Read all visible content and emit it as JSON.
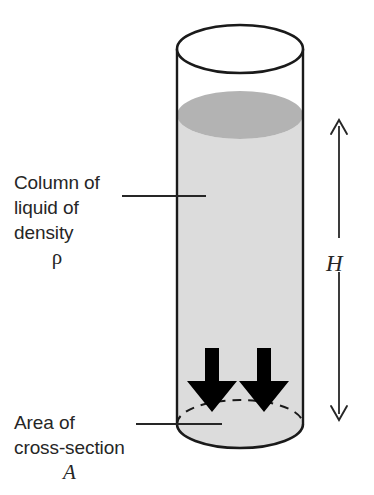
{
  "diagram": {
    "labels": {
      "column_line1": "Column of",
      "column_line2": "liquid of",
      "column_line3": "density",
      "column_symbol": "ρ",
      "area_line1": "Area of",
      "area_line2": "cross-section",
      "area_symbol": "A",
      "height_symbol": "H"
    },
    "colors": {
      "outline": "#1a1a1a",
      "liquid_body": "#dcdcdc",
      "liquid_surface": "#b4b4b4",
      "arrow_fill": "#000000",
      "text": "#262626",
      "background": "#ffffff"
    },
    "geometry": {
      "cylinder_left": 177,
      "cylinder_right": 303,
      "cylinder_top_ellipse_cy": 49,
      "cylinder_bottom_ellipse_cy": 424,
      "ellipse_rx": 63,
      "ellipse_ry": 24,
      "liquid_surface_cy": 115,
      "height_arrow_x": 339,
      "height_arrow_top": 120,
      "height_arrow_bottom": 420
    },
    "force_arrows": {
      "count": 2,
      "direction": "down",
      "left_arrow_center_x": 212,
      "right_arrow_center_x": 264,
      "top_y": 348,
      "tip_y": 412
    }
  }
}
